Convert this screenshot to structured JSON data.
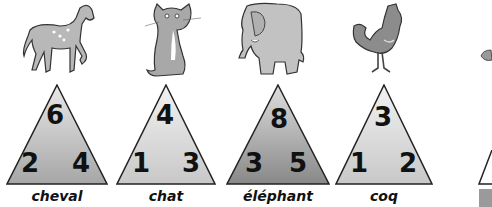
{
  "cards": [
    {
      "animal": "cheval",
      "top": "6",
      "left": "2",
      "right": "4",
      "shade": "medium"
    },
    {
      "animal": "chat",
      "top": "4",
      "left": "1",
      "right": "3",
      "shade": "light"
    },
    {
      "animal": "éléphant",
      "top": "8",
      "left": "3",
      "right": "5",
      "shade": "dark"
    },
    {
      "animal": "coq",
      "top": "3",
      "left": "1",
      "right": "2",
      "shade": "light"
    }
  ],
  "colors": {
    "light_top": "#f2f2f2",
    "light_bottom": "#c8c8c8",
    "medium_top": "#e6e6e6",
    "medium_bottom": "#a8a8a8",
    "dark_top": "#dcdcdc",
    "dark_bottom": "#8a8a8a",
    "stroke": "#222222"
  }
}
